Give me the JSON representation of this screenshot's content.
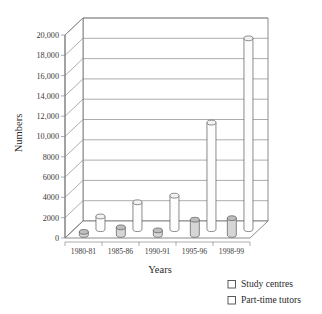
{
  "chart_data": {
    "type": "bar",
    "title": "",
    "subtitle": "",
    "xlabel": "Years",
    "ylabel": "Numbers",
    "categories": [
      "1980-81",
      "1985-86",
      "1990-91",
      "1995-96",
      "1998-99"
    ],
    "series": [
      {
        "name": "Study centres",
        "values": [
          300,
          750,
          450,
          1500,
          1650
        ],
        "color": "#d6d6d6"
      },
      {
        "name": "Part-time tutors",
        "values": [
          1250,
          2650,
          3300,
          10500,
          18800
        ],
        "color": "#fdfdfd"
      }
    ],
    "ylim": [
      0,
      20000
    ],
    "ytick_step": 2000,
    "ytick_labels": [
      "0",
      "2000",
      "4000",
      "6000",
      "8000",
      "10,000",
      "12,000",
      "14,000",
      "16,000",
      "18,000",
      "20,000"
    ],
    "ytick_values": [
      0,
      2000,
      4000,
      6000,
      8000,
      10000,
      12000,
      14000,
      16000,
      18000,
      20000
    ],
    "grid": true,
    "legend_position": "bottom-right",
    "style": "3d-cylinder"
  },
  "axes": {
    "y_title": "Numbers",
    "x_title": "Years"
  },
  "legend": {
    "entries": [
      {
        "label": "Study centres",
        "marker": "square-outline"
      },
      {
        "label": "Part-time tutors",
        "marker": "square-outline"
      }
    ]
  }
}
